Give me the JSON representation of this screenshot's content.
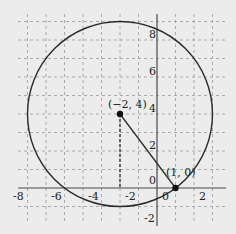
{
  "diagram": {
    "type": "coordinate-plane-circle",
    "grid": {
      "x_min": -7,
      "x_max": 3,
      "y_min": -2,
      "y_max": 9,
      "step": 1
    },
    "x_axis_labels": [
      "-8",
      "-6",
      "-4",
      "-2",
      "0",
      "2"
    ],
    "y_axis_labels": [
      "8",
      "6",
      "4",
      "2",
      "0",
      "-2"
    ],
    "circle": {
      "center_x": -2,
      "center_y": 4,
      "radius": 5
    },
    "points": [
      {
        "label": "(−2, 4)",
        "x": -2,
        "y": 4
      },
      {
        "label": "(1, 0)",
        "x": 1,
        "y": 0
      }
    ],
    "colors": {
      "background": "#ececec",
      "ink": "#2a2a2a",
      "grid": "#9a9a9a"
    }
  }
}
